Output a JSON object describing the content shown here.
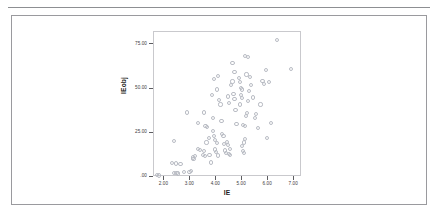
{
  "figure": {
    "frame_border_color": "#9a9a9e",
    "rule_color": "#8d8f92",
    "background": "#ffffff"
  },
  "chart_data": {
    "type": "scatter",
    "title": "",
    "subtitle": "",
    "xlabel": "IE",
    "ylabel": "IEobj",
    "xlim": [
      1.6,
      7.3
    ],
    "ylim": [
      0,
      82
    ],
    "xticks": [
      2.0,
      3.0,
      4.0,
      5.0,
      6.0,
      7.0
    ],
    "xticklabels": [
      "2.00",
      "3.00",
      "4.00",
      "5.00",
      "6.00",
      "7.00"
    ],
    "yticks": [
      0,
      25,
      50,
      75
    ],
    "yticklabels": [
      ".00",
      "25.00",
      "50.00",
      "75.00"
    ],
    "grid": false,
    "legend": null,
    "marker": "open-circle",
    "marker_color": "#b9bcc4",
    "panel_border_color": "#c9c9cd",
    "series": [
      {
        "name": "IEobj vs IE",
        "points": [
          [
            1.7,
            1.0
          ],
          [
            1.78,
            0.8
          ],
          [
            2.38,
            2.2
          ],
          [
            2.47,
            2.4
          ],
          [
            2.52,
            2.0
          ],
          [
            2.74,
            2.6
          ],
          [
            2.3,
            8.0
          ],
          [
            2.45,
            7.6
          ],
          [
            2.62,
            7.2
          ],
          [
            2.38,
            20.5
          ],
          [
            2.97,
            3.0
          ],
          [
            3.02,
            3.4
          ],
          [
            3.1,
            11.0
          ],
          [
            3.18,
            12.0
          ],
          [
            3.12,
            10.2
          ],
          [
            3.3,
            16.0
          ],
          [
            3.38,
            15.2
          ],
          [
            3.52,
            14.8
          ],
          [
            2.86,
            36.5
          ],
          [
            3.3,
            30.5
          ],
          [
            3.52,
            36.5
          ],
          [
            3.58,
            29.0
          ],
          [
            3.64,
            28.2
          ],
          [
            3.72,
            22.0
          ],
          [
            3.62,
            19.5
          ],
          [
            3.48,
            12.6
          ],
          [
            3.56,
            12.0
          ],
          [
            3.74,
            12.4
          ],
          [
            3.8,
            8.2
          ],
          [
            3.86,
            33.5
          ],
          [
            3.88,
            26.0
          ],
          [
            3.92,
            23.0
          ],
          [
            3.96,
            21.0
          ],
          [
            4.02,
            19.0
          ],
          [
            3.94,
            15.5
          ],
          [
            4.0,
            14.0
          ],
          [
            4.06,
            12.2
          ],
          [
            3.82,
            46.5
          ],
          [
            3.92,
            55.5
          ],
          [
            4.08,
            57.0
          ],
          [
            4.02,
            49.5
          ],
          [
            4.1,
            43.5
          ],
          [
            4.16,
            41.0
          ],
          [
            4.2,
            31.5
          ],
          [
            4.22,
            24.5
          ],
          [
            4.28,
            23.0
          ],
          [
            4.3,
            18.5
          ],
          [
            4.34,
            15.0
          ],
          [
            4.38,
            13.8
          ],
          [
            4.4,
            20.0
          ],
          [
            4.46,
            18.0
          ],
          [
            4.48,
            13.0
          ],
          [
            4.54,
            12.5
          ],
          [
            4.52,
            16.0
          ],
          [
            4.44,
            45.5
          ],
          [
            4.5,
            42.0
          ],
          [
            4.58,
            52.0
          ],
          [
            4.62,
            54.0
          ],
          [
            4.66,
            47.0
          ],
          [
            4.7,
            44.0
          ],
          [
            4.74,
            38.0
          ],
          [
            4.78,
            30.0
          ],
          [
            4.62,
            64.5
          ],
          [
            4.7,
            59.5
          ],
          [
            4.86,
            56.0
          ],
          [
            4.9,
            53.5
          ],
          [
            4.94,
            50.5
          ],
          [
            4.98,
            49.5
          ],
          [
            4.96,
            46.5
          ],
          [
            5.0,
            44.5
          ],
          [
            4.92,
            41.0
          ],
          [
            4.98,
            17.5
          ],
          [
            5.02,
            14.5
          ],
          [
            5.06,
            13.5
          ],
          [
            5.08,
            19.5
          ],
          [
            5.12,
            21.5
          ],
          [
            5.04,
            29.5
          ],
          [
            5.1,
            28.8
          ],
          [
            5.14,
            34.5
          ],
          [
            5.18,
            36.0
          ],
          [
            5.22,
            43.0
          ],
          [
            5.26,
            48.5
          ],
          [
            5.1,
            68.5
          ],
          [
            5.22,
            68.0
          ],
          [
            5.16,
            58.0
          ],
          [
            5.3,
            56.5
          ],
          [
            5.34,
            52.0
          ],
          [
            5.4,
            45.0
          ],
          [
            5.48,
            33.5
          ],
          [
            5.52,
            35.5
          ],
          [
            5.62,
            27.5
          ],
          [
            5.7,
            41.0
          ],
          [
            5.78,
            54.5
          ],
          [
            5.84,
            52.5
          ],
          [
            5.9,
            60.5
          ],
          [
            6.02,
            53.5
          ],
          [
            6.1,
            30.5
          ],
          [
            6.34,
            77.5
          ],
          [
            6.88,
            61.0
          ],
          [
            5.96,
            22.0
          ]
        ]
      }
    ]
  }
}
